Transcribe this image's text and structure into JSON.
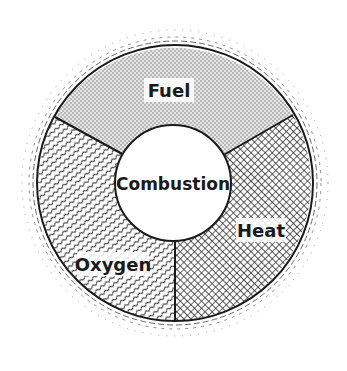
{
  "diagram": {
    "center": {
      "label": "Combustion"
    },
    "segments": [
      {
        "id": "fuel",
        "label": "Fuel",
        "pattern": "stipple"
      },
      {
        "id": "heat",
        "label": "Heat",
        "pattern": "crosshatch"
      },
      {
        "id": "oxygen",
        "label": "Oxygen",
        "pattern": "wavy-lines"
      }
    ],
    "colors": {
      "ink": "#1a1a1a",
      "background": "#ffffff"
    }
  }
}
